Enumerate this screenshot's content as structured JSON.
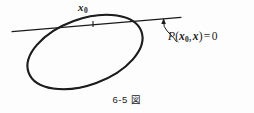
{
  "figure": {
    "domain": "diagram",
    "title_caption": "6-5",
    "caption_suffix": "図",
    "background_color": "#fdfdfd",
    "ink_color": "#1a1a1a",
    "labels": {
      "tangent_point": {
        "base": "x",
        "subscript": "0",
        "text": "x₀"
      },
      "equation": {
        "function": "P",
        "open_paren": "(",
        "arg1_base": "x",
        "arg1_subscript": "0",
        "comma": ",",
        "arg2": "x",
        "close_paren": ")",
        "equals": "=",
        "value": "0",
        "text": "P(x₀, x) = 0"
      }
    },
    "geometry": {
      "ellipse": {
        "center_x": 85,
        "center_y": 52,
        "radius_x": 60,
        "radius_y": 33,
        "rotation_deg": -20,
        "stroke_width": 2.0
      },
      "tangent_line": {
        "x1": 12,
        "y1": 31.5,
        "x2": 181,
        "y2": 17.5,
        "stroke_width": 1.1
      },
      "tangent_point_marker": {
        "x": 93,
        "y": 24.5
      },
      "leader_arrow": {
        "from_x": 176,
        "from_y": 41,
        "to_x": 163.5,
        "to_y": 19,
        "stroke_width": 1.0
      }
    }
  }
}
